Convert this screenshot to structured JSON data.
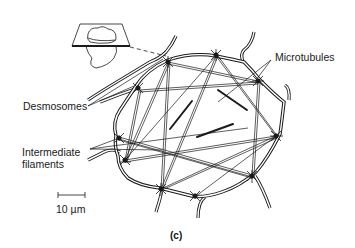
{
  "figure": {
    "panel_label": "(c)",
    "labels": {
      "microtubules": "Microtubules",
      "desmosomes": "Desmosomes",
      "intermediate_filaments_line1": "Intermediate",
      "intermediate_filaments_line2": "filaments"
    },
    "scale_bar": {
      "label": "10 µm"
    },
    "colors": {
      "ink": "#1a1a1a",
      "background": "#ffffff"
    }
  }
}
